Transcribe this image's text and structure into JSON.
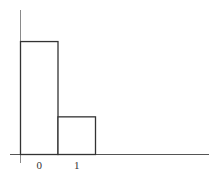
{
  "chart_data": {
    "type": "bar",
    "title": "",
    "xlabel": "",
    "ylabel": "",
    "categories": [
      "0",
      "1"
    ],
    "values": [
      3,
      1
    ],
    "ylim": [
      0,
      3.4
    ],
    "grid": false,
    "legend": null
  },
  "colors": {
    "axis": "#555555",
    "bar_stroke": "#333333",
    "bar_fill": "#ffffff",
    "label": "#333333"
  }
}
